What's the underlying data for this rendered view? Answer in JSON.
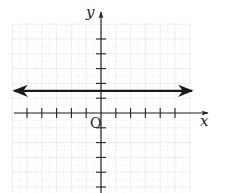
{
  "chart_data": {
    "type": "line",
    "title": "",
    "xlabel": "x",
    "ylabel": "y",
    "origin_label": "O",
    "xlim": [
      -6,
      7
    ],
    "ylim": [
      -5,
      6
    ],
    "grid": true,
    "x_ticks": [
      -5,
      -4,
      -3,
      -2,
      -1,
      1,
      2,
      3,
      4,
      5
    ],
    "y_ticks": [
      -5,
      -4,
      -3,
      -2,
      -1,
      1,
      2,
      3,
      4,
      5
    ],
    "tick_labels_shown": false,
    "series": [
      {
        "name": "horizontal line",
        "equation": "y = 1.5",
        "x": [
          -6,
          6
        ],
        "y": [
          1.5,
          1.5
        ],
        "arrows_both_ends": true,
        "color": "#1a1a1a"
      }
    ],
    "colors": {
      "axis": "#222222",
      "grid": "#c8c8c8",
      "line": "#1a1a1a"
    }
  }
}
